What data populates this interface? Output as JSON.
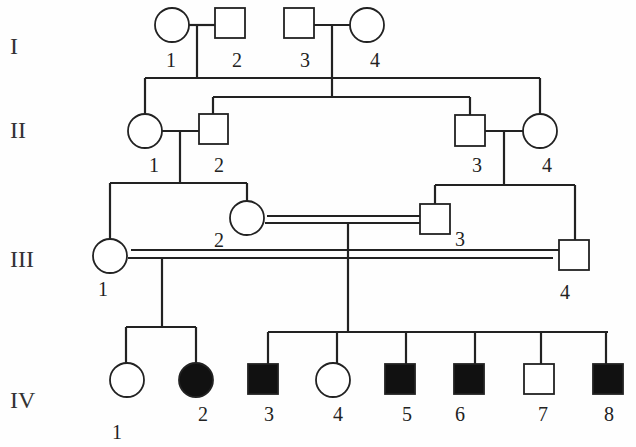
{
  "diagram": {
    "type": "pedigree",
    "colors": {
      "line": "#222222",
      "affected": "#111111",
      "unaffected": "#ffffff"
    },
    "generations": [
      {
        "id": "I",
        "label": "I"
      },
      {
        "id": "II",
        "label": "II"
      },
      {
        "id": "III",
        "label": "III"
      },
      {
        "id": "IV",
        "label": "IV"
      }
    ],
    "individuals": {
      "I": [
        {
          "num": "1",
          "sex": "female",
          "affected": false
        },
        {
          "num": "2",
          "sex": "male",
          "affected": false
        },
        {
          "num": "3",
          "sex": "male",
          "affected": false
        },
        {
          "num": "4",
          "sex": "female",
          "affected": false
        }
      ],
      "II": [
        {
          "num": "1",
          "sex": "female",
          "affected": false
        },
        {
          "num": "2",
          "sex": "male",
          "affected": false
        },
        {
          "num": "3",
          "sex": "male",
          "affected": false
        },
        {
          "num": "4",
          "sex": "female",
          "affected": false
        }
      ],
      "III": [
        {
          "num": "1",
          "sex": "female",
          "affected": false
        },
        {
          "num": "2",
          "sex": "female",
          "affected": false
        },
        {
          "num": "3",
          "sex": "male",
          "affected": false
        },
        {
          "num": "4",
          "sex": "male",
          "affected": false
        }
      ],
      "IV": [
        {
          "num": "1",
          "sex": "female",
          "affected": false
        },
        {
          "num": "2",
          "sex": "female",
          "affected": true
        },
        {
          "num": "3",
          "sex": "male",
          "affected": true
        },
        {
          "num": "4",
          "sex": "female",
          "affected": false
        },
        {
          "num": "5",
          "sex": "male",
          "affected": true
        },
        {
          "num": "6",
          "sex": "male",
          "affected": true
        },
        {
          "num": "7",
          "sex": "male",
          "affected": false
        },
        {
          "num": "8",
          "sex": "male",
          "affected": true
        }
      ]
    },
    "relationships": [
      {
        "couple": [
          "I-1",
          "I-2"
        ],
        "consanguineous": false,
        "children": [
          "II-1",
          "II-4"
        ]
      },
      {
        "couple": [
          "I-3",
          "I-4"
        ],
        "consanguineous": false,
        "children": [
          "II-2",
          "II-3"
        ]
      },
      {
        "couple": [
          "II-1",
          "II-2"
        ],
        "consanguineous": false,
        "children": [
          "III-1",
          "III-2"
        ]
      },
      {
        "couple": [
          "II-3",
          "II-4"
        ],
        "consanguineous": false,
        "children": [
          "III-3",
          "III-4"
        ]
      },
      {
        "couple": [
          "III-2",
          "III-3"
        ],
        "consanguineous": true,
        "children": [
          "IV-3",
          "IV-4",
          "IV-5",
          "IV-6",
          "IV-7",
          "IV-8"
        ]
      },
      {
        "couple": [
          "III-1",
          "III-4"
        ],
        "consanguineous": true,
        "children": [
          "IV-1",
          "IV-2"
        ]
      }
    ]
  }
}
